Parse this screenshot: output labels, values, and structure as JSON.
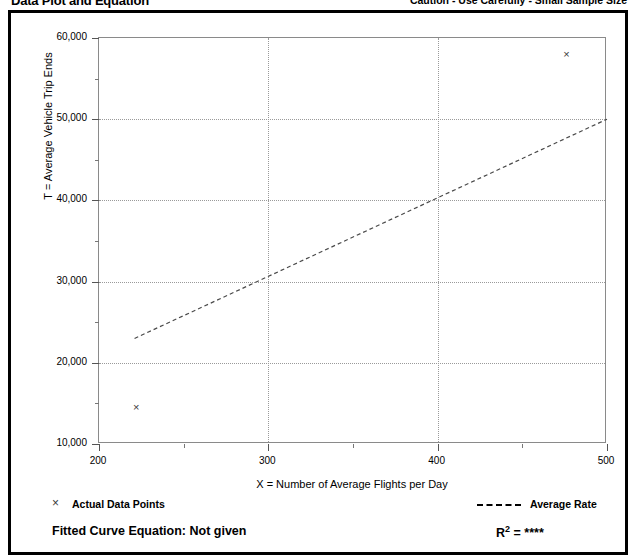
{
  "header": {
    "title": "Data Plot and Equation",
    "caution": "Caution - Use Carefully - Small Sample Size"
  },
  "legend": {
    "marker_glyph": "×",
    "points_label": "Actual Data Points",
    "rate_label": "Average Rate",
    "fitted_equation": "Fitted Curve Equation:  Not given",
    "r_squared_prefix": "R",
    "r_squared_exp": "2",
    "r_squared_value": " = ****"
  },
  "chart_data": {
    "type": "scatter",
    "title": "Data Plot and Equation",
    "xlabel": "X = Number of Average Flights per Day",
    "ylabel": "T = Average Vehicle Trip Ends",
    "xlim": [
      200,
      500
    ],
    "ylim": [
      10000,
      60000
    ],
    "grid": true,
    "x_ticks_major": [
      200,
      300,
      400,
      500
    ],
    "x_ticks_major_labels": [
      "200",
      "300",
      "400",
      "500"
    ],
    "x_ticks_minor": [
      250,
      350,
      450
    ],
    "y_ticks_major": [
      10000,
      20000,
      30000,
      40000,
      50000,
      60000
    ],
    "y_ticks_major_labels": [
      "10,000",
      "20,000",
      "30,000",
      "40,000",
      "50,000",
      "60,000"
    ],
    "y_ticks_minor": [
      15000,
      25000,
      35000,
      45000,
      55000
    ],
    "gridlines_x": [
      300,
      400
    ],
    "gridlines_y": [
      20000,
      30000,
      40000,
      50000
    ],
    "series": [
      {
        "name": "Actual Data Points",
        "marker": "x",
        "points": [
          {
            "x": 222,
            "y": 14500
          },
          {
            "x": 476,
            "y": 58000
          }
        ]
      },
      {
        "name": "Average Rate",
        "style": "dashed",
        "line": [
          {
            "x": 221,
            "y": 23000
          },
          {
            "x": 500,
            "y": 50000
          }
        ]
      }
    ],
    "legend_position": "below-plot"
  }
}
